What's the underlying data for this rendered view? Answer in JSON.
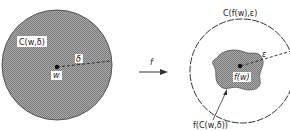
{
  "figure": {
    "left_disk": {
      "label": "C(w,δ)",
      "center_label": "w",
      "radius_label": "δ"
    },
    "mapping_arrow": {
      "label": "f"
    },
    "right_disk": {
      "label": "C(f(w),ε)",
      "center_label": "f(w)",
      "radius_label": "ε",
      "image_region_label": "f(C(w,δ))"
    }
  },
  "colors": {
    "fill_gray": "#9a9a9a",
    "hatch_dark": "#7a7a7a",
    "outline": "#444444",
    "text": "#222222"
  }
}
